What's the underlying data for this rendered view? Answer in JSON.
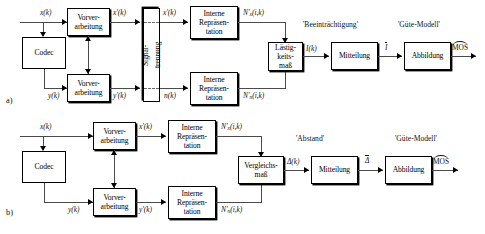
{
  "figure": {
    "type": "block-diagram",
    "panels": [
      {
        "id": "a",
        "label": "a)",
        "blocks": [
          {
            "name": "codec",
            "text": "Codec"
          },
          {
            "name": "preprocessing-top",
            "text": "Vorver-\narbeitung",
            "line1": "Vorver-",
            "line2": "arbeitung"
          },
          {
            "name": "preprocessing-bottom",
            "text": "Vorver-\narbeitung",
            "line1": "Vorver-",
            "line2": "arbeitung"
          },
          {
            "name": "signal-separation",
            "line1": "Signal-",
            "line2": "trennung"
          },
          {
            "name": "internal-representation-top",
            "line1": "Interne",
            "line2": "Repräsen-",
            "line3": "tation"
          },
          {
            "name": "internal-representation-bottom",
            "line1": "Interne",
            "line2": "Repräsen-",
            "line3": "tation"
          },
          {
            "name": "annoyance-measure",
            "line1": "Lästig-",
            "line2": "keits-",
            "line3": "maß"
          },
          {
            "name": "averaging",
            "text": "Mitteilung"
          },
          {
            "name": "mapping",
            "text": "Abbildung"
          }
        ],
        "signal_labels": {
          "input_x": "x(k)",
          "input_y": "y(k)",
          "pre_x": "x'(k)",
          "pre_y": "y'(k)",
          "sep_x": "x'(k)",
          "sep_n": "n(k)",
          "nx": "N'",
          "nx_sub": "x",
          "nx_arg": "(i,k)",
          "nn": "N'",
          "nn_sub": "n",
          "nn_arg": "(i,k)",
          "annoyance_out": "I(k)",
          "averaged": "I",
          "output": "MOS"
        },
        "group_labels": {
          "impairment": "'Beeinträchtigung'",
          "quality_model": "'Güte-Modell'"
        }
      },
      {
        "id": "b",
        "label": "b)",
        "blocks": [
          {
            "name": "codec",
            "text": "Codec"
          },
          {
            "name": "preprocessing-top",
            "line1": "Vorver-",
            "line2": "arbeitung"
          },
          {
            "name": "preprocessing-bottom",
            "line1": "Vorver-",
            "line2": "arbeitung"
          },
          {
            "name": "internal-representation-top",
            "line1": "Interne",
            "line2": "Repräsen-",
            "line3": "tation"
          },
          {
            "name": "internal-representation-bottom",
            "line1": "Interne",
            "line2": "Repräsen-",
            "line3": "tation"
          },
          {
            "name": "comparison-measure",
            "line1": "Vergleichs-",
            "line2": "maß"
          },
          {
            "name": "averaging",
            "text": "Mitteilung"
          },
          {
            "name": "mapping",
            "text": "Abbildung"
          }
        ],
        "signal_labels": {
          "input_x": "x(k)",
          "input_y": "y(k)",
          "pre_x": "x'(k)",
          "pre_y": "y'(k)",
          "nx": "N'",
          "nx_sub": "x",
          "nx_arg": "(i,k)",
          "nn": "N'",
          "nn_sub": "n",
          "nn_arg": "(i,k)",
          "comparison_out": "Δ(k)",
          "averaged": "Δ",
          "output": "MOS"
        },
        "group_labels": {
          "distance": "'Abstand'",
          "quality_model": "'Güte-Modell'"
        }
      }
    ],
    "colors": {
      "stroke": "#000000",
      "line": "#4a4a4a",
      "background": "#ffffff",
      "text": "#111111"
    }
  }
}
